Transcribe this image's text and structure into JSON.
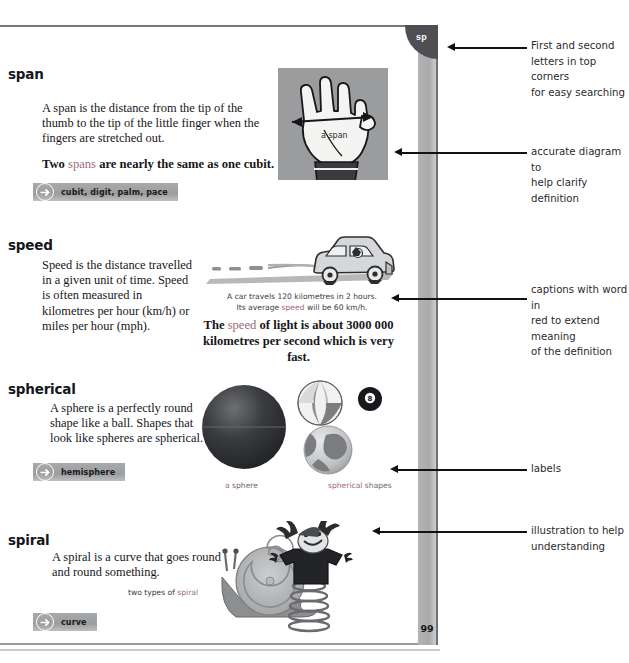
{
  "page": {
    "corner_tab_label": "sp",
    "page_number": "99"
  },
  "entries": [
    {
      "headword": "span",
      "definition": "A span is the distance from the tip of the thumb to the tip of the little finger when the fingers are stretched out.",
      "fact_before": "Two ",
      "fact_keyword": "spans",
      "fact_after": " are nearly the same as one cubit.",
      "xref": "cubit, digit, palm, pace",
      "illustration_label": "a span"
    },
    {
      "headword": "speed",
      "definition": "Speed is the distance travelled in a given unit of time. Speed is often measured in kilometres per hour (km/h) or miles per hour (mph).",
      "caption_line1": "A car travels 120 kilometres in 2 hours.",
      "caption_line2_before": "Its average ",
      "caption_line2_keyword": "speed",
      "caption_line2_after": " will be 60 km/h.",
      "fact_before": "The ",
      "fact_keyword": "speed",
      "fact_after": " of light is about 3000 000 kilometres per second which is very fast."
    },
    {
      "headword": "spherical",
      "definition": "A sphere is a perfectly round shape like a ball. Shapes that look like spheres are spherical.",
      "xref": "hemisphere",
      "label_left_kw": "a ",
      "label_left": "sphere",
      "label_right_kw": "spherical ",
      "label_right": "shapes",
      "ball_number": "8"
    },
    {
      "headword": "spiral",
      "definition": "A spiral is a curve that goes round and round something.",
      "caption_before": "two types of ",
      "caption_keyword": "spiral",
      "xref": "curve"
    }
  ],
  "annotations": [
    {
      "id": "anno-corner",
      "line1": "First and second",
      "line2": "letters in top corners",
      "line3": "for easy searching"
    },
    {
      "id": "anno-diagram",
      "line1": "accurate diagram to",
      "line2": "help clarify definition",
      "line3": ""
    },
    {
      "id": "anno-caption",
      "line1": "captions with word in",
      "line2": "red to extend meaning",
      "line3": "of the definition"
    },
    {
      "id": "anno-labels",
      "line1": "labels",
      "line2": "",
      "line3": ""
    },
    {
      "id": "anno-illus",
      "line1": "illustration to help",
      "line2": "understanding",
      "line3": ""
    }
  ],
  "colors": {
    "keyword_red": "#9d6c70",
    "xref_bar": "#a3a4a5",
    "tab_dark": "#4e4f52",
    "gutter_gray": "#acadae"
  }
}
